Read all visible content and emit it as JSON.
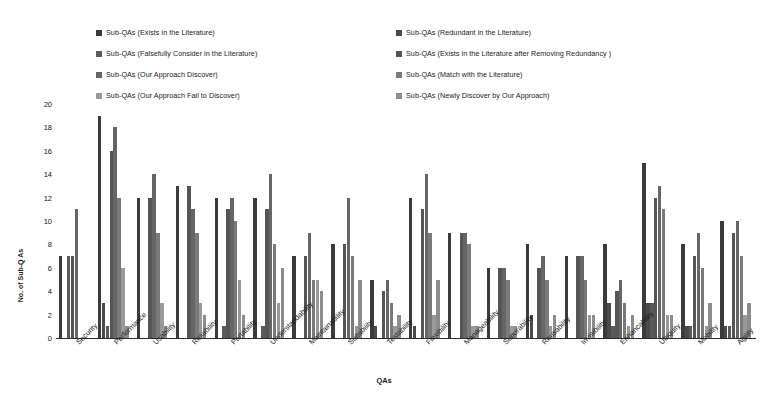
{
  "chart_data": {
    "type": "bar",
    "title": "",
    "xlabel": "QAs",
    "ylabel": "No. of Sub-Q As",
    "ylim": [
      0,
      20
    ],
    "ytick_step": 2,
    "yticks": [
      20,
      18,
      16,
      14,
      12,
      10,
      8,
      6,
      4,
      2,
      0
    ],
    "grid": false,
    "legend_position": "top",
    "categories": [
      "Security",
      "Performance",
      "Usability",
      "Reliability",
      "Portability",
      "Understandability",
      "Maintainability",
      "Suitability",
      "Testability",
      "Flexibility",
      "Manageability",
      "Suporability",
      "Reusability",
      "Invisibility",
      "Enhancability",
      "Ubiquity",
      "Mobility",
      "Agility"
    ],
    "series": [
      {
        "name": "Sub-QAs (Exists in the Literature)",
        "color": "#3b3b3b",
        "values": [
          7,
          19,
          12,
          13,
          12,
          12,
          7,
          8,
          5,
          12,
          9,
          6,
          8,
          7,
          8,
          15,
          8,
          10
        ]
      },
      {
        "name": "Sub-QAs (Redundant in the Literature)",
        "color": "#4a4a4a",
        "values": [
          0,
          3,
          0,
          0,
          0,
          0,
          0,
          0,
          1,
          1,
          0,
          0,
          2,
          0,
          3,
          3,
          1,
          1
        ]
      },
      {
        "name": "Sub-QAs (Falsefully Consider  in the Literature)",
        "color": "#5a5a5a",
        "values": [
          7,
          1,
          0,
          0,
          1,
          1,
          0,
          0,
          0,
          0,
          0,
          0,
          0,
          0,
          1,
          3,
          1,
          1
        ]
      },
      {
        "name": "Sub-QAs (Exists in the Literature after Removing Redundancy )",
        "color": "#555555",
        "values": [
          7,
          16,
          12,
          13,
          11,
          11,
          7,
          8,
          4,
          11,
          9,
          6,
          6,
          7,
          4,
          12,
          7,
          9
        ]
      },
      {
        "name": "Sub-QAs (Our Approach Discover)",
        "color": "#666666",
        "values": [
          11,
          18,
          14,
          11,
          12,
          14,
          9,
          12,
          5,
          14,
          9,
          6,
          7,
          7,
          5,
          13,
          9,
          10
        ]
      },
      {
        "name": "Sub-QAs (Match with the Literature)",
        "color": "#7a7a7a",
        "values": [
          0,
          12,
          9,
          9,
          10,
          8,
          5,
          7,
          3,
          9,
          8,
          5,
          5,
          5,
          3,
          11,
          6,
          7
        ]
      },
      {
        "name": "Sub-QAs (Our Approach Fail to Discover)",
        "color": "#9a9a9a",
        "values": [
          0,
          6,
          3,
          3,
          5,
          3,
          5,
          1,
          1,
          2,
          1,
          1,
          1,
          2,
          1,
          2,
          1,
          2
        ]
      },
      {
        "name": "Sub-QAs (Newly Discover by Our Approach)",
        "color": "#8c8c8c",
        "values": [
          0,
          1,
          1,
          2,
          2,
          6,
          4,
          5,
          2,
          5,
          1,
          1,
          2,
          2,
          2,
          2,
          3,
          3
        ]
      }
    ]
  }
}
